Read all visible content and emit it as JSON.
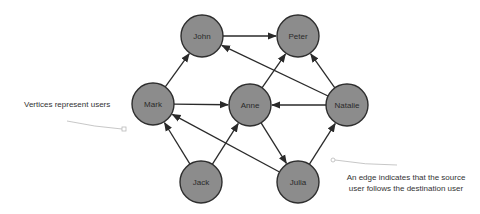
{
  "diagram": {
    "title": "",
    "colors": {
      "node_fill": "#8c8c8c",
      "node_stroke": "#2e2e2e",
      "edge": "#2a2a2a",
      "text": "#2a2a2a",
      "annotation_line": "#b9b9b9",
      "background": "#ffffff"
    },
    "nodes": [
      {
        "id": "john",
        "label": "John",
        "x": 202,
        "y": 36,
        "r": 21
      },
      {
        "id": "peter",
        "label": "Peter",
        "x": 298,
        "y": 36,
        "r": 21
      },
      {
        "id": "mark",
        "label": "Mark",
        "x": 153,
        "y": 104,
        "r": 21
      },
      {
        "id": "anne",
        "label": "Anne",
        "x": 250,
        "y": 105,
        "r": 21
      },
      {
        "id": "natalie",
        "label": "Natalie",
        "x": 347,
        "y": 105,
        "r": 21
      },
      {
        "id": "jack",
        "label": "Jack",
        "x": 201,
        "y": 182,
        "r": 21
      },
      {
        "id": "julia",
        "label": "Julia",
        "x": 298,
        "y": 182,
        "r": 21
      }
    ],
    "edges": [
      {
        "from": "mark",
        "to": "john"
      },
      {
        "from": "john",
        "to": "peter"
      },
      {
        "from": "mark",
        "to": "anne"
      },
      {
        "from": "anne",
        "to": "peter"
      },
      {
        "from": "natalie",
        "to": "peter"
      },
      {
        "from": "natalie",
        "to": "john"
      },
      {
        "from": "natalie",
        "to": "anne"
      },
      {
        "from": "anne",
        "to": "julia"
      },
      {
        "from": "julia",
        "to": "natalie"
      },
      {
        "from": "jack",
        "to": "mark"
      },
      {
        "from": "jack",
        "to": "anne"
      },
      {
        "from": "julia",
        "to": "mark"
      }
    ],
    "annotations": [
      {
        "id": "vertices-note",
        "lines": [
          "Vertices represent users"
        ],
        "text_x": 24,
        "text_y": 104,
        "anchor": "start",
        "pointer": {
          "path": "M67,121 Q95,127 122,129",
          "end_x": 124,
          "end_y": 129,
          "end_shape": "square"
        }
      },
      {
        "id": "edge-note",
        "lines": [
          "An edge indicates that the source",
          "user follows the destination user"
        ],
        "text_x": 406,
        "text_y": 177,
        "anchor": "middle",
        "pointer": {
          "path": "M335,160 Q365,165 397,165",
          "end_x": 333,
          "end_y": 160,
          "end_shape": "circle"
        }
      }
    ]
  }
}
